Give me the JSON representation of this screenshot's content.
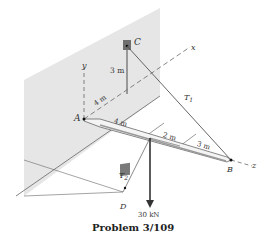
{
  "figure": {
    "caption": "Problem 3/109",
    "points": {
      "A": "A",
      "B": "B",
      "C": "C",
      "D": "D"
    },
    "axes": {
      "x": "x",
      "y": "y",
      "z": "z"
    },
    "dimensions": {
      "wall_vertical": "3 m",
      "wall_horizontal": "4 m",
      "beam_seg1": "4 m",
      "beam_seg2": "2 m",
      "beam_seg3": "3 m"
    },
    "forces": {
      "tension1": "T",
      "tension1_sub": "1",
      "tension2": "T",
      "tension2_sub": "2",
      "load": "30 kN"
    },
    "colors": {
      "wall": "#e6e6e6",
      "line": "#444444",
      "anchor": "#6f6f6f"
    }
  }
}
